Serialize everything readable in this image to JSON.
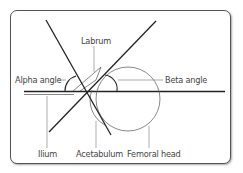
{
  "diagram": {
    "labels": {
      "labrum": "Labrum",
      "alpha_angle": "Alpha angle",
      "beta_angle": "Beta angle",
      "ilium": "Ilium",
      "acetabulum": "Acetabulum",
      "femoral_head": "Femoral head"
    },
    "colors": {
      "line": "#2a2a2a",
      "leader": "#666666",
      "text": "#444444",
      "border": "#555555"
    }
  }
}
